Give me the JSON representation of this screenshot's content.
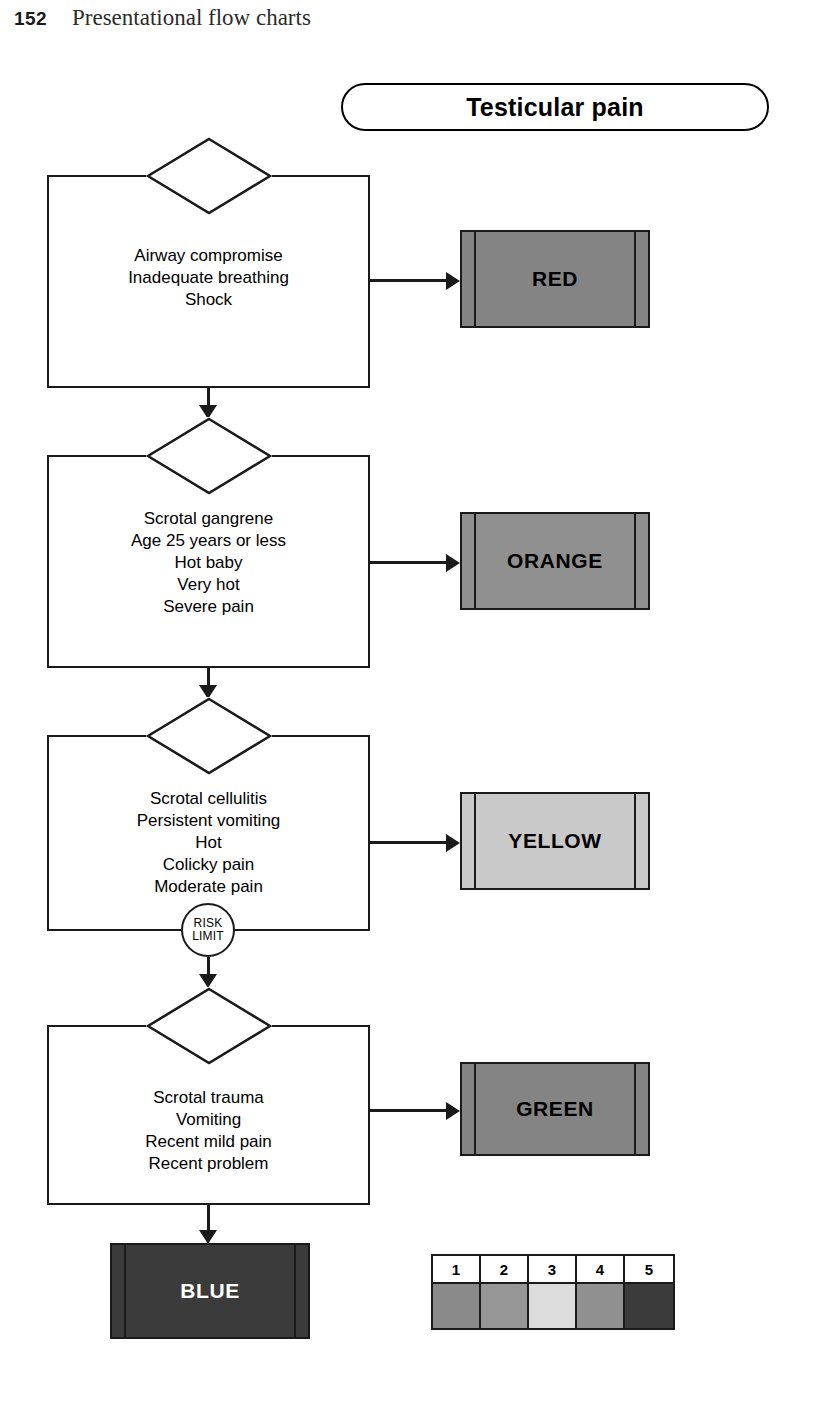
{
  "page": {
    "number": "152",
    "running_head": "Presentational flow charts"
  },
  "chart_title": "Testicular pain",
  "nodes": [
    {
      "id": "node-red",
      "discriminators": "Airway compromise\nInadequate breathing\nShock",
      "category_label": "RED",
      "category_color": "#848484",
      "category_text_color": "#000000"
    },
    {
      "id": "node-orange",
      "discriminators": "Scrotal gangrene\nAge 25 years or less\nHot baby\nVery hot\nSevere pain",
      "category_label": "ORANGE",
      "category_color": "#909090",
      "category_text_color": "#000000"
    },
    {
      "id": "node-yellow",
      "discriminators": "Scrotal cellulitis\nPersistent vomiting\nHot\nColicky pain\nModerate pain",
      "category_label": "YELLOW",
      "category_color": "#c9c9c9",
      "category_text_color": "#000000"
    },
    {
      "id": "node-green",
      "discriminators": "Scrotal trauma\nVomiting\nRecent mild pain\nRecent problem",
      "category_label": "GREEN",
      "category_color": "#848484",
      "category_text_color": "#000000"
    }
  ],
  "terminal": {
    "category_label": "BLUE",
    "category_color": "#3b3b3b",
    "category_text_color": "#ffffff"
  },
  "risk_limit": {
    "line1": "RISK",
    "line2": "LIMIT"
  },
  "legend": {
    "numbers": [
      "1",
      "2",
      "3",
      "4",
      "5"
    ],
    "colors": [
      "#8a8a8a",
      "#969696",
      "#dcdcdc",
      "#909090",
      "#3b3b3b"
    ]
  }
}
